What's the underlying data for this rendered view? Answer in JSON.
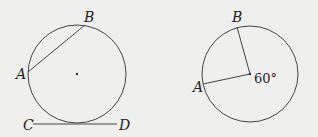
{
  "figures": [
    {
      "id": "left",
      "description": "Circle with chord AB and tangent line CD at bottom",
      "labels": {
        "A": "A",
        "B": "B",
        "C": "C",
        "D": "D"
      }
    },
    {
      "id": "right",
      "description": "Circle with radii to A and B forming central angle",
      "labels": {
        "A": "A",
        "B": "B",
        "angle": "60°"
      }
    }
  ],
  "colors": {
    "background": "#efefed",
    "stroke": "#444444",
    "text": "#222222"
  }
}
